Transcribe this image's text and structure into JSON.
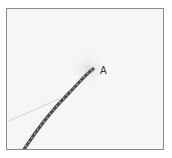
{
  "figure": {
    "label": "A",
    "colors": {
      "background": "#f6f6f4",
      "border": "#8a8a8a",
      "wire": "#4a4a4a",
      "wire_stripe": "#9a9a9a",
      "thin_line": "#c8c8c8",
      "label": "#333333"
    }
  }
}
